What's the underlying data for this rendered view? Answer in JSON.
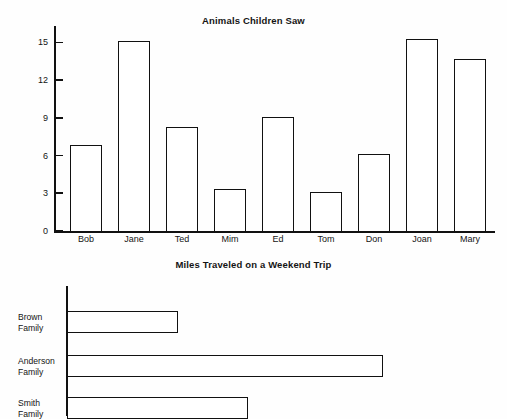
{
  "page": {
    "background": "#fefefe",
    "ink": "#111111"
  },
  "chart_data": [
    {
      "type": "bar",
      "orientation": "vertical",
      "title": "Animals Children Saw",
      "xlabel": "",
      "ylabel": "",
      "categories": [
        "Bob",
        "Jane",
        "Ted",
        "Mim",
        "Ed",
        "Tom",
        "Don",
        "Joan",
        "Mary"
      ],
      "values": [
        6.8,
        15.1,
        8.3,
        3.3,
        9.05,
        3.1,
        6.1,
        15.25,
        13.7
      ],
      "ylim": [
        0,
        16.3
      ],
      "yticks": [
        0,
        3,
        6,
        9,
        12,
        15
      ],
      "ytick_labels": [
        "0",
        "3",
        "6",
        "9",
        "12",
        "15"
      ],
      "grid": false,
      "legend": "none",
      "bar_fill": "#ffffff",
      "bar_edge": "#111111"
    },
    {
      "type": "bar",
      "orientation": "horizontal",
      "title": "Miles Traveled on a Weekend Trip",
      "xlabel": "",
      "ylabel": "",
      "categories": [
        "Brown Family",
        "Anderson Family",
        "Smith Family"
      ],
      "category_lines": [
        [
          "Brown",
          "Family"
        ],
        [
          "Anderson",
          "Family"
        ],
        [
          "Smith",
          "Family"
        ]
      ],
      "values": [
        111,
        316,
        181
      ],
      "xlim": [
        0,
        428
      ],
      "xticks": [],
      "grid": false,
      "legend": "none",
      "bar_fill": "#ffffff",
      "bar_edge": "#111111"
    }
  ]
}
